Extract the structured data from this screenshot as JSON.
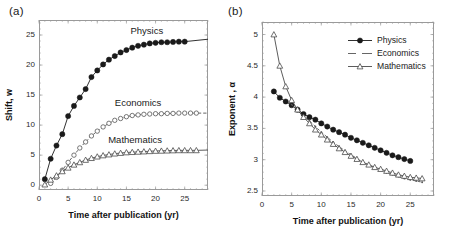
{
  "figure": {
    "background": "#ffffff",
    "panels": [
      {
        "id": "a",
        "label": "(a)",
        "chart_index": 0
      },
      {
        "id": "b",
        "label": "(b)",
        "chart_index": 1
      }
    ]
  },
  "colors": {
    "physics": "#1a1a1a",
    "economics": "#555555",
    "mathematics": "#4a4a4a",
    "axis": "#9a9a9a",
    "text": "#1a1a1a"
  },
  "chart_data": [
    {
      "type": "scatter",
      "panel": "a",
      "title": "",
      "xlabel": "Time after publication (yr)",
      "ylabel": "Shift, w",
      "xlim": [
        0,
        29
      ],
      "ylim": [
        -0.8,
        27.5
      ],
      "xticks": [
        0,
        5,
        10,
        15,
        20,
        25
      ],
      "yticks": [
        0,
        5,
        10,
        15,
        20,
        25
      ],
      "xtick_labels": [
        "0",
        "5",
        "10",
        "15",
        "20",
        "25"
      ],
      "ytick_labels": [
        "0",
        "5",
        "10",
        "15",
        "20",
        "25"
      ],
      "grid": false,
      "legend_position": "inline-annotations",
      "annotations": [
        {
          "text": "Physics",
          "x": 18.5,
          "y": 25.6
        },
        {
          "text": "Economics",
          "x": 17.0,
          "y": 13.6
        },
        {
          "text": "Mathematics",
          "x": 16.5,
          "y": 7.6
        }
      ],
      "series": [
        {
          "name": "Physics",
          "marker": "filled-circle",
          "line": "solid",
          "x": [
            1,
            2,
            3,
            4,
            5,
            6,
            7,
            8,
            9,
            10,
            11,
            12,
            13,
            14,
            15,
            16,
            17,
            18,
            19,
            20,
            21,
            22,
            23,
            24,
            25
          ],
          "values": [
            1.0,
            4.4,
            6.6,
            8.5,
            11.5,
            13.2,
            14.6,
            16.0,
            18.0,
            19.1,
            20.1,
            20.9,
            21.5,
            22.1,
            22.5,
            22.9,
            23.2,
            23.4,
            23.6,
            23.7,
            23.8,
            23.8,
            23.85,
            23.9,
            23.9
          ],
          "fit_asymptote": 24.3
        },
        {
          "name": "Economics",
          "marker": "open-circle",
          "line": "dashed",
          "x": [
            2,
            3,
            4,
            5,
            6,
            7,
            8,
            9,
            10,
            11,
            12,
            13,
            14,
            15,
            16,
            17,
            18,
            19,
            20,
            21,
            22,
            23,
            24,
            25,
            26,
            27
          ],
          "values": [
            0.3,
            1.3,
            2.5,
            3.8,
            5.0,
            6.2,
            7.2,
            8.2,
            9.0,
            9.7,
            10.3,
            10.8,
            11.1,
            11.4,
            11.6,
            11.7,
            11.8,
            11.85,
            11.9,
            11.9,
            11.95,
            11.95,
            12.0,
            12.0,
            12.0,
            12.0
          ],
          "fit_asymptote": 12.0
        },
        {
          "name": "Mathematics",
          "marker": "open-triangle",
          "line": "solid",
          "x": [
            1,
            2,
            3,
            4,
            5,
            6,
            7,
            8,
            9,
            10,
            11,
            12,
            13,
            14,
            15,
            16,
            17,
            18,
            19,
            20,
            21,
            22,
            23,
            24,
            25,
            26,
            27
          ],
          "values": [
            0.1,
            0.9,
            1.6,
            2.3,
            2.9,
            3.4,
            3.8,
            4.2,
            4.5,
            4.75,
            4.95,
            5.1,
            5.25,
            5.35,
            5.45,
            5.5,
            5.55,
            5.6,
            5.65,
            5.7,
            5.72,
            5.75,
            5.78,
            5.8,
            5.8,
            5.8,
            5.8
          ],
          "fit_asymptote": 5.85
        }
      ]
    },
    {
      "type": "scatter",
      "panel": "b",
      "title": "",
      "xlabel": "Time after publication (yr)",
      "ylabel": "Exponent , α",
      "xlim": [
        0,
        29
      ],
      "ylim": [
        2.42,
        5.2
      ],
      "xticks": [
        0,
        5,
        10,
        15,
        20,
        25
      ],
      "yticks": [
        2.5,
        3,
        3.5,
        4,
        4.5,
        5
      ],
      "xtick_labels": [
        "0",
        "5",
        "10",
        "15",
        "20",
        "25"
      ],
      "ytick_labels": [
        "2.5",
        "3",
        "3.5",
        "4",
        "4.5",
        "5"
      ],
      "grid": false,
      "legend_position": "top-right",
      "legend": [
        "Physics",
        "Economics",
        "Mathematics"
      ],
      "series": [
        {
          "name": "Physics",
          "marker": "filled-circle",
          "line": "solid",
          "x": [
            2,
            3,
            4,
            5,
            6,
            7,
            8,
            9,
            10,
            11,
            12,
            13,
            14,
            15,
            16,
            17,
            18,
            19,
            20,
            21,
            22,
            23,
            24,
            25
          ],
          "values": [
            4.09,
            3.99,
            3.93,
            3.87,
            3.8,
            3.73,
            3.68,
            3.64,
            3.58,
            3.53,
            3.48,
            3.44,
            3.4,
            3.35,
            3.31,
            3.27,
            3.23,
            3.19,
            3.15,
            3.11,
            3.07,
            3.04,
            3.01,
            2.98
          ]
        },
        {
          "name": "Economics",
          "marker": "dot",
          "line": "dashed",
          "x": [
            5,
            6,
            7,
            8,
            9,
            10,
            11,
            12,
            13,
            14,
            15,
            16,
            17,
            18,
            19,
            20,
            21,
            22,
            23,
            24,
            25,
            26,
            27
          ],
          "values": [
            3.88,
            3.78,
            3.7,
            3.62,
            3.53,
            3.44,
            3.36,
            3.28,
            3.21,
            3.14,
            3.08,
            3.02,
            2.96,
            2.91,
            2.87,
            2.83,
            2.79,
            2.76,
            2.73,
            2.7,
            2.68,
            2.66,
            2.64
          ]
        },
        {
          "name": "Mathematics",
          "marker": "open-triangle",
          "line": "solid",
          "x": [
            2,
            3,
            4,
            5,
            6,
            7,
            8,
            9,
            10,
            11,
            12,
            13,
            14,
            15,
            16,
            17,
            18,
            19,
            20,
            21,
            22,
            23,
            24,
            25,
            26,
            27
          ],
          "values": [
            5.0,
            4.5,
            4.17,
            3.95,
            3.8,
            3.68,
            3.58,
            3.48,
            3.4,
            3.32,
            3.25,
            3.18,
            3.12,
            3.06,
            3.01,
            2.96,
            2.92,
            2.88,
            2.85,
            2.82,
            2.79,
            2.76,
            2.74,
            2.72,
            2.71,
            2.7
          ]
        }
      ]
    }
  ]
}
